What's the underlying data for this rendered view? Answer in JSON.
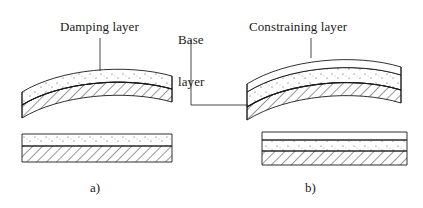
{
  "figure": {
    "type": "technical-diagram",
    "background_color": "#ffffff",
    "line_color": "#1a1a1a",
    "fill_color": "#ffffff"
  },
  "labels": {
    "damping_layer": "Damping layer",
    "base_layer_line1": "Base",
    "base_layer_line2": "layer",
    "constraining_layer": "Constraining layer"
  },
  "captions": {
    "left": "a)",
    "right": "b)"
  },
  "panels": [
    {
      "id": "a",
      "caption": "a)",
      "description": "Free layer (unconstrained) damping treatment",
      "layer_count": 2,
      "layers": [
        {
          "name": "Damping layer",
          "pattern": "stippled",
          "position": "top"
        },
        {
          "name": "Base layer",
          "pattern": "hatched",
          "position": "bottom"
        }
      ],
      "states": [
        {
          "name": "deformed",
          "shape": "curved-upward"
        },
        {
          "name": "undeformed",
          "shape": "flat"
        }
      ]
    },
    {
      "id": "b",
      "caption": "b)",
      "description": "Constrained layer damping treatment",
      "layer_count": 3,
      "layers": [
        {
          "name": "Constraining layer",
          "pattern": "blank",
          "position": "top"
        },
        {
          "name": "Damping layer",
          "pattern": "stippled",
          "position": "middle"
        },
        {
          "name": "Base layer",
          "pattern": "hatched",
          "position": "bottom"
        }
      ],
      "states": [
        {
          "name": "deformed",
          "shape": "curved-upward"
        },
        {
          "name": "undeformed",
          "shape": "flat"
        }
      ]
    }
  ],
  "leaders": [
    {
      "from": "Damping layer",
      "to": "panel-a-damping-layer"
    },
    {
      "from": "Base layer",
      "to": "panel-b-base-layer"
    },
    {
      "from": "Constraining layer",
      "to": "panel-b-constraining-layer"
    }
  ]
}
